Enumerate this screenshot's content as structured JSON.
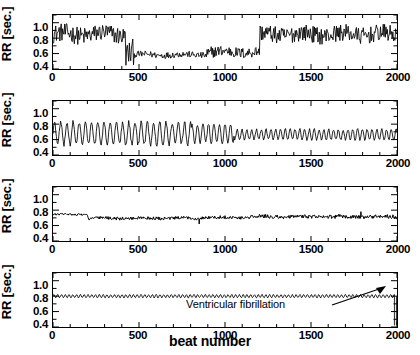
{
  "figure": {
    "xlabel": "beat number",
    "ylabel": "RR [sec.]",
    "xticks": [
      "0",
      "500",
      "1000",
      "1500",
      "2000"
    ],
    "yticks": [
      "1.0",
      "0.8",
      "0.6",
      "0.4"
    ],
    "panels": [
      {
        "key": "a",
        "title": "(a) Normal"
      },
      {
        "key": "b",
        "title": "(b) Sleep apnea"
      },
      {
        "key": "c",
        "title": "(c) Congestive heart failure"
      },
      {
        "key": "d",
        "title": "(d) Sudden cardiac death"
      }
    ],
    "annotations": {
      "vf": "Ventricular fibrillation"
    }
  },
  "chart_data": [
    {
      "type": "line",
      "title": "(a) Normal",
      "xlabel": "beat number",
      "ylabel": "RR [sec.]",
      "xlim": [
        0,
        2000
      ],
      "ylim": [
        0.4,
        1.1
      ],
      "xticks": [
        0,
        500,
        1000,
        1500,
        2000
      ],
      "yticks": [
        0.4,
        0.6,
        0.8,
        1.0
      ],
      "grid": false,
      "legend": "none",
      "description": "Normal sinus rhythm: RR intervals fluctuate around 0.85 s for the first ~420 beats, drop abruptly to a plateau near 0.58 s between beats ~470 and ~1200, then recover to ~0.85 s through beat 2000.",
      "segments": [
        {
          "beats": [
            0,
            420
          ],
          "mean": 0.85,
          "band": [
            0.72,
            1.0
          ]
        },
        {
          "beats": [
            420,
            470
          ],
          "mean": 0.62,
          "band": [
            0.5,
            0.9
          ]
        },
        {
          "beats": [
            470,
            890
          ],
          "mean": 0.585,
          "band": [
            0.54,
            0.64
          ]
        },
        {
          "beats": [
            890,
            930
          ],
          "mean": 0.6,
          "band": [
            0.5,
            0.75
          ]
        },
        {
          "beats": [
            930,
            1200
          ],
          "mean": 0.62,
          "band": [
            0.55,
            0.72
          ]
        },
        {
          "beats": [
            1200,
            2000
          ],
          "mean": 0.85,
          "band": [
            0.72,
            0.98
          ]
        }
      ]
    },
    {
      "type": "line",
      "title": "(b) Sleep apnea",
      "xlabel": "beat number",
      "ylabel": "RR [sec.]",
      "xlim": [
        0,
        2000
      ],
      "ylim": [
        0.4,
        1.1
      ],
      "xticks": [
        0,
        500,
        1000,
        1500,
        2000
      ],
      "yticks": [
        0.4,
        0.6,
        0.8,
        1.0
      ],
      "grid": false,
      "legend": "none",
      "description": "Sleep apnea: strong periodic oscillation of RR interval, amplitude ~0.55-0.85 s with a period of roughly 30-40 beats up to beat ~1000, after which the oscillation amplitude damps to ~0.6-0.75 s.",
      "segments": [
        {
          "beats": [
            0,
            800
          ],
          "mean": 0.68,
          "band": [
            0.54,
            0.86
          ],
          "period": 36
        },
        {
          "beats": [
            800,
            1050
          ],
          "mean": 0.68,
          "band": [
            0.56,
            0.83
          ],
          "period": 32
        },
        {
          "beats": [
            1050,
            2000
          ],
          "mean": 0.665,
          "band": [
            0.6,
            0.75
          ],
          "period": 28
        }
      ]
    },
    {
      "type": "line",
      "title": "(c) Congestive heart failure",
      "xlabel": "beat number",
      "ylabel": "RR [sec.]",
      "xlim": [
        0,
        2000
      ],
      "ylim": [
        0.4,
        1.1
      ],
      "xticks": [
        0,
        500,
        1000,
        1500,
        2000
      ],
      "yticks": [
        0.4,
        0.6,
        0.8,
        1.0
      ],
      "grid": false,
      "legend": "none",
      "description": "Congestive heart failure: markedly reduced variability. RR starts near 0.75 s, settles to a nearly flat trace around 0.70 s with very small fluctuations, plus isolated narrow spikes near beats 850 and 1790.",
      "segments": [
        {
          "beats": [
            0,
            200
          ],
          "mean": 0.745,
          "band": [
            0.73,
            0.76
          ]
        },
        {
          "beats": [
            200,
            850
          ],
          "mean": 0.695,
          "band": [
            0.67,
            0.72
          ]
        },
        {
          "beats": [
            850,
            1150
          ],
          "mean": 0.705,
          "band": [
            0.68,
            0.73
          ]
        },
        {
          "beats": [
            1150,
            2000
          ],
          "mean": 0.715,
          "band": [
            0.69,
            0.75
          ]
        }
      ],
      "spikes": [
        {
          "beat": 850,
          "value": 0.62
        },
        {
          "beat": 1790,
          "value": 0.78
        }
      ]
    },
    {
      "type": "line",
      "title": "(d) Sudden cardiac death",
      "xlabel": "beat number",
      "ylabel": "RR [sec.]",
      "xlim": [
        0,
        2000
      ],
      "ylim": [
        0.4,
        1.1
      ],
      "xticks": [
        0,
        500,
        1000,
        1500,
        2000
      ],
      "yticks": [
        0.4,
        0.6,
        0.8,
        1.0
      ],
      "grid": false,
      "legend": "none",
      "description": "Sudden cardiac death: almost constant RR near 0.80 s with tiny regular oscillations, terminated by an abrupt vertical collapse at beat ~1985 marked as ventricular fibrillation.",
      "segments": [
        {
          "beats": [
            0,
            1980
          ],
          "mean": 0.8,
          "band": [
            0.78,
            0.825
          ],
          "period": 22
        }
      ],
      "event": {
        "beat": 1985,
        "label": "Ventricular fibrillation",
        "value_range": [
          0.42,
          0.8
        ]
      }
    }
  ]
}
